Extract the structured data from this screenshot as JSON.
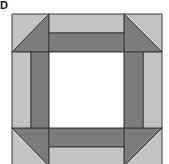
{
  "figure": {
    "label": "D",
    "colors": {
      "light": "#c4c4c4",
      "dark": "#7c7c7c",
      "center": "#ffffff",
      "line": "#3a3a3a"
    },
    "grid": {
      "x": [
        12,
        49,
        124,
        162
      ],
      "y": [
        14,
        52,
        128,
        166
      ],
      "band_inner": {
        "top": 33,
        "left": 31,
        "right": 143,
        "bottom": 147
      }
    }
  }
}
